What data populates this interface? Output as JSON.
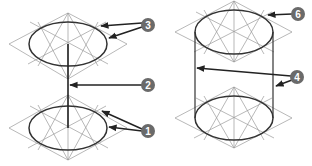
{
  "figure": {
    "colors": {
      "construction_line": "#9a9a9a",
      "ellipse": "#333333",
      "badge_fill": "#6a6a6a",
      "badge_text": "#ffffff"
    }
  },
  "callouts": [
    {
      "id": "c3",
      "label": "3",
      "x": 148,
      "y": 25
    },
    {
      "id": "c2",
      "label": "2",
      "x": 148,
      "y": 85
    },
    {
      "id": "c1",
      "label": "1",
      "x": 148,
      "y": 131
    },
    {
      "id": "c6",
      "label": "6",
      "x": 298,
      "y": 14
    },
    {
      "id": "c4",
      "label": "4",
      "x": 297,
      "y": 77
    }
  ],
  "labels": {
    "c1": "1",
    "c2": "2",
    "c3": "3",
    "c4": "4",
    "c6": "6"
  }
}
